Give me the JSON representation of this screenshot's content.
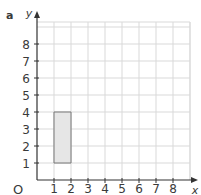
{
  "part_label": "a",
  "axes": {
    "x_label": "x",
    "y_label": "y",
    "origin_label": "O",
    "x_ticks": [
      "1",
      "2",
      "3",
      "4",
      "5",
      "6",
      "7",
      "8"
    ],
    "y_ticks": [
      "1",
      "2",
      "3",
      "4",
      "5",
      "6",
      "7",
      "8"
    ]
  },
  "shape": {
    "type": "rectangle",
    "vertices": [
      [
        1,
        1
      ],
      [
        2,
        1
      ],
      [
        2,
        4
      ],
      [
        1,
        4
      ]
    ],
    "fill": "#e6e6e6",
    "stroke": "#777777"
  },
  "colors": {
    "grid": "#d9d9d9",
    "axis": "#333333",
    "text": "#3a3a3a"
  }
}
